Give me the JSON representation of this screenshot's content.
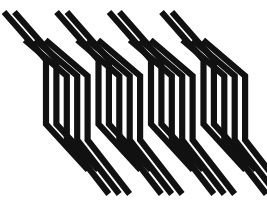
{
  "artwork": {
    "title": "Optical Stripe Pattern",
    "type": "abstract-geometric-graphic",
    "canvas": {
      "width": 267,
      "height": 206
    },
    "background_color": "#ffffff",
    "stroke_color": "#111111",
    "description": "Twenty black stripes, each bending from a down-right diagonal into a vertical segment and back out into a down-right diagonal, arranged in four repeating groups of five with staggered vertical offsets.",
    "group_count": 4,
    "stripes_per_group": 5,
    "stripe_total": 20,
    "stripe_width": 6.2,
    "group_pitch": 52.5,
    "stripe_pitch": 10.4,
    "diagonal_run": 42,
    "stagger_step": 9.5,
    "geometry": {
      "top_y": 12,
      "bottom_y": 194,
      "first_bend_base": 70,
      "second_bend_base": 132,
      "first_group_x": 18
    },
    "stripes": [
      {
        "id": 1,
        "group": 1,
        "index": 1,
        "x_vertical": 46.0,
        "top_y": 12.0,
        "bend_in_y": 60.0,
        "bend_out_y": 124.0,
        "bottom_y": 170.0
      },
      {
        "id": 2,
        "group": 1,
        "index": 2,
        "x_vertical": 56.4,
        "top_y": 12.0,
        "bend_in_y": 60.0,
        "bend_out_y": 124.0,
        "bottom_y": 170.0
      },
      {
        "id": 3,
        "group": 1,
        "index": 3,
        "x_vertical": 66.8,
        "top_y": 40.0,
        "bend_in_y": 76.0,
        "bend_out_y": 140.0,
        "bottom_y": 194.0
      },
      {
        "id": 4,
        "group": 1,
        "index": 4,
        "x_vertical": 77.2,
        "top_y": 40.0,
        "bend_in_y": 76.0,
        "bend_out_y": 140.0,
        "bottom_y": 194.0
      },
      {
        "id": 5,
        "group": 1,
        "index": 5,
        "x_vertical": 87.6,
        "top_y": 40.0,
        "bend_in_y": 76.0,
        "bend_out_y": 140.0,
        "bottom_y": 194.0
      },
      {
        "id": 6,
        "group": 2,
        "index": 1,
        "x_vertical": 98.5,
        "top_y": 12.0,
        "bend_in_y": 60.0,
        "bend_out_y": 124.0,
        "bottom_y": 170.0
      },
      {
        "id": 7,
        "group": 2,
        "index": 2,
        "x_vertical": 108.9,
        "top_y": 12.0,
        "bend_in_y": 60.0,
        "bend_out_y": 124.0,
        "bottom_y": 170.0
      },
      {
        "id": 8,
        "group": 2,
        "index": 3,
        "x_vertical": 119.3,
        "top_y": 40.0,
        "bend_in_y": 76.0,
        "bend_out_y": 140.0,
        "bottom_y": 194.0
      },
      {
        "id": 9,
        "group": 2,
        "index": 4,
        "x_vertical": 129.7,
        "top_y": 40.0,
        "bend_in_y": 76.0,
        "bend_out_y": 140.0,
        "bottom_y": 194.0
      },
      {
        "id": 10,
        "group": 2,
        "index": 5,
        "x_vertical": 140.1,
        "top_y": 40.0,
        "bend_in_y": 76.0,
        "bend_out_y": 140.0,
        "bottom_y": 194.0
      },
      {
        "id": 11,
        "group": 3,
        "index": 1,
        "x_vertical": 151.0,
        "top_y": 12.0,
        "bend_in_y": 60.0,
        "bend_out_y": 124.0,
        "bottom_y": 170.0
      },
      {
        "id": 12,
        "group": 3,
        "index": 2,
        "x_vertical": 161.4,
        "top_y": 12.0,
        "bend_in_y": 60.0,
        "bend_out_y": 124.0,
        "bottom_y": 170.0
      },
      {
        "id": 13,
        "group": 3,
        "index": 3,
        "x_vertical": 171.8,
        "top_y": 40.0,
        "bend_in_y": 76.0,
        "bend_out_y": 140.0,
        "bottom_y": 194.0
      },
      {
        "id": 14,
        "group": 3,
        "index": 4,
        "x_vertical": 182.2,
        "top_y": 40.0,
        "bend_in_y": 76.0,
        "bend_out_y": 140.0,
        "bottom_y": 194.0
      },
      {
        "id": 15,
        "group": 3,
        "index": 5,
        "x_vertical": 192.6,
        "top_y": 40.0,
        "bend_in_y": 76.0,
        "bend_out_y": 140.0,
        "bottom_y": 194.0
      },
      {
        "id": 16,
        "group": 4,
        "index": 1,
        "x_vertical": 203.5,
        "top_y": 12.0,
        "bend_in_y": 60.0,
        "bend_out_y": 124.0,
        "bottom_y": 170.0
      },
      {
        "id": 17,
        "group": 4,
        "index": 2,
        "x_vertical": 213.9,
        "top_y": 12.0,
        "bend_in_y": 60.0,
        "bend_out_y": 124.0,
        "bottom_y": 170.0
      },
      {
        "id": 18,
        "group": 4,
        "index": 3,
        "x_vertical": 224.3,
        "top_y": 40.0,
        "bend_in_y": 76.0,
        "bend_out_y": 140.0,
        "bottom_y": 194.0
      },
      {
        "id": 19,
        "group": 4,
        "index": 4,
        "x_vertical": 234.7,
        "top_y": 40.0,
        "bend_in_y": 76.0,
        "bend_out_y": 140.0,
        "bottom_y": 194.0
      },
      {
        "id": 20,
        "group": 4,
        "index": 5,
        "x_vertical": 245.1,
        "top_y": 40.0,
        "bend_in_y": 76.0,
        "bend_out_y": 140.0,
        "bottom_y": 194.0
      }
    ]
  }
}
